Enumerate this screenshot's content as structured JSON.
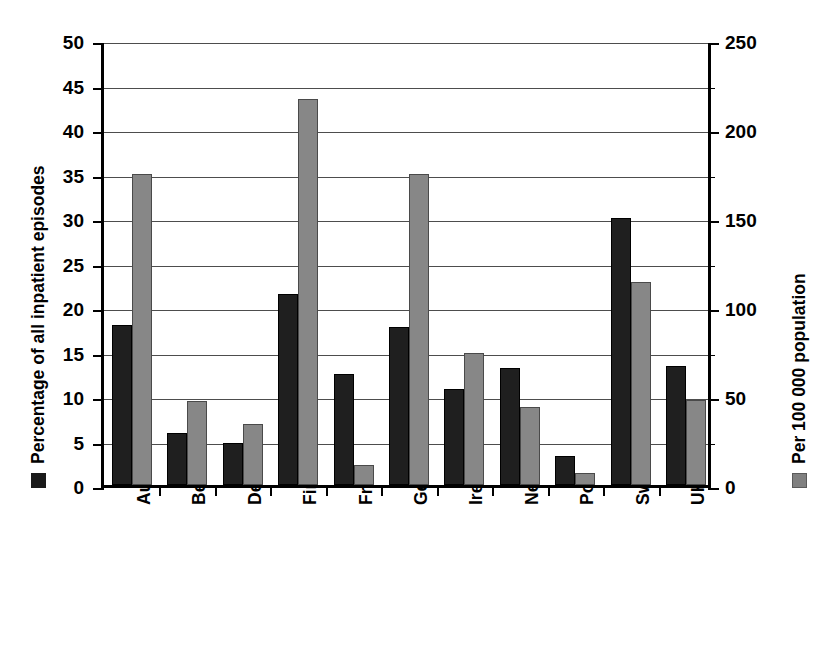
{
  "chart_data": {
    "type": "bar",
    "title": "",
    "subtitle": "",
    "xlabel": "",
    "categories": [
      "Austria",
      "Belgium",
      "Denmark",
      "Finalnd",
      "France",
      "Germany",
      "Ireland",
      "Netherlands",
      "Portugal",
      "Sweden",
      "UK (England)"
    ],
    "series": [
      {
        "name": "Percentage of all inpatient episodes",
        "axis": "left",
        "color": "#1f1f1f",
        "values": [
          18.0,
          5.9,
          4.7,
          21.5,
          12.5,
          17.7,
          10.8,
          13.2,
          3.3,
          30.0,
          13.4
        ]
      },
      {
        "name": "Per 100 000 population",
        "axis": "right",
        "color": "#878787",
        "values": [
          175,
          47,
          34,
          217,
          11,
          175,
          74,
          44,
          7,
          114,
          48
        ]
      }
    ],
    "left_axis": {
      "label": "Percentage of all inpatient episodes",
      "ticks": [
        0,
        5,
        10,
        15,
        20,
        25,
        30,
        35,
        40,
        45,
        50
      ],
      "ylim": [
        0,
        50
      ],
      "swatch_color": "#1a1a1a"
    },
    "right_axis": {
      "label": "Per 100 000 population",
      "ticks": [
        0,
        50,
        100,
        150,
        200,
        250
      ],
      "minor_ticks": [
        25,
        75,
        125,
        175,
        225
      ],
      "ylim": [
        0,
        250
      ],
      "swatch_color": "#808080"
    },
    "grid": true,
    "gridlines_at": [
      5,
      10,
      15,
      20,
      25,
      30,
      35,
      40,
      45,
      50
    ],
    "legend_position": "axis-titles"
  }
}
